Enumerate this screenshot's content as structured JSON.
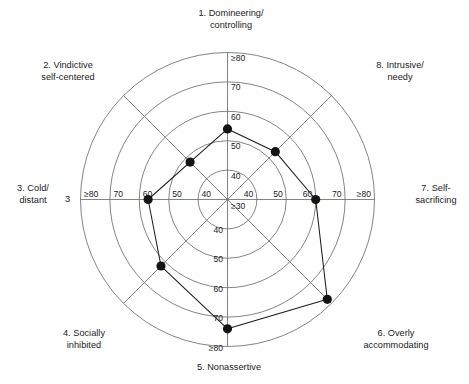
{
  "chart_data": {
    "type": "radar",
    "title": "",
    "subtitle": "",
    "xlabel": "",
    "ylabel": "",
    "grid": true,
    "legend_position": "none",
    "center_label": "≥30",
    "radial_ticks": [
      "40",
      "50",
      "60",
      "70",
      "≥80"
    ],
    "radial_tick_values": [
      40,
      50,
      60,
      70,
      80
    ],
    "radial_range": [
      30,
      80
    ],
    "categories": [
      "1. Domineering/\ncontrolling",
      "2. Vindictive\nself-centered",
      "3. Cold/\ndistant",
      "4. Socially\ninhibited",
      "5. Nonassertive",
      "6. Overly\naccommodating",
      "7. Self-\nsacrificing",
      "8. Intrusive/\nneedy"
    ],
    "series": [
      {
        "name": "IIP-32 profile",
        "values": [
          54,
          48,
          57,
          62,
          74,
          78,
          60,
          53
        ],
        "marker": "filled-circle",
        "marker_color": "#141414",
        "line_color": "#1a1a1a"
      }
    ],
    "annotations": [
      {
        "text": "3",
        "position": "left-of-axis-3"
      }
    ]
  },
  "axes": [
    {
      "id": 1,
      "label": "1. Domineering/\ncontrolling",
      "angle_deg": 90,
      "value": 54
    },
    {
      "id": 2,
      "label": "2. Vindictive\nself-centered",
      "angle_deg": 135,
      "value": 48
    },
    {
      "id": 3,
      "label": "3. Cold/\ndistant",
      "angle_deg": 180,
      "value": 57
    },
    {
      "id": 4,
      "label": "4. Socially\ninhibited",
      "angle_deg": 225,
      "value": 62
    },
    {
      "id": 5,
      "label": "5. Nonassertive",
      "angle_deg": 270,
      "value": 74
    },
    {
      "id": 6,
      "label": "6. Overly\naccommodating",
      "angle_deg": 315,
      "value": 78
    },
    {
      "id": 7,
      "label": "7. Self-\nsacrificing",
      "angle_deg": 0,
      "value": 60
    },
    {
      "id": 8,
      "label": "8. Intrusive/\nneedy",
      "angle_deg": 45,
      "value": 53
    }
  ],
  "ticks": {
    "up": [
      "40",
      "50",
      "60",
      "70",
      "≥80"
    ],
    "down": [
      "40",
      "50",
      "60",
      "70",
      "≥80"
    ],
    "left": [
      "40",
      "50",
      "60",
      "70",
      "≥80"
    ],
    "right": [
      "40",
      "50",
      "60",
      "70",
      "≥80"
    ],
    "center_up": "40",
    "center_right": "40",
    "center_down": "40",
    "center_left": "40",
    "center": "≥30"
  },
  "stray": {
    "text": "3"
  },
  "colors": {
    "grid": "#6e6e6e",
    "line": "#1a1a1a",
    "marker": "#141414",
    "text": "#1a1a1a",
    "background": "#ffffff"
  }
}
